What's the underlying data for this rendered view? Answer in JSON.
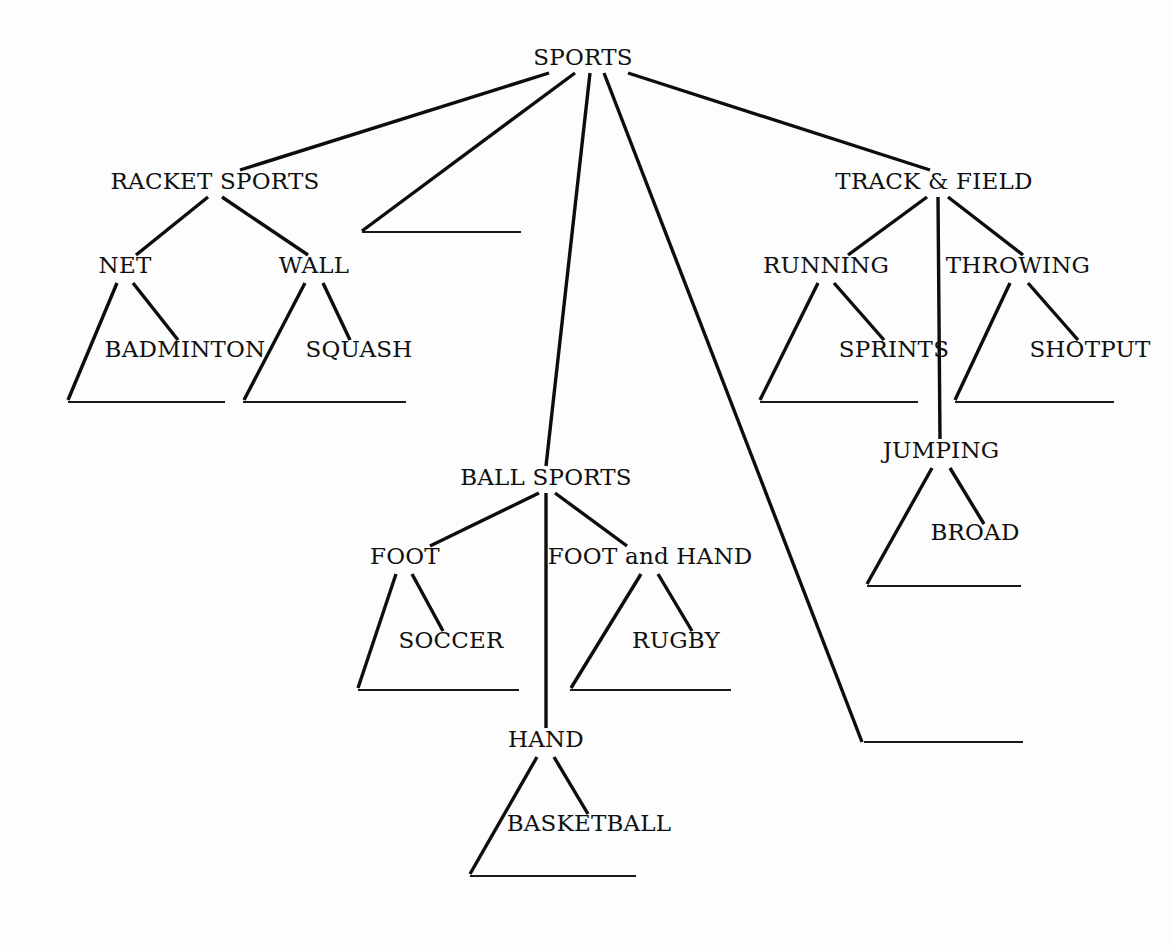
{
  "diagram": {
    "type": "hierarchy-tree-worksheet",
    "background_color": "#fdfdfd",
    "line_color": "#0d0d0d",
    "text_color": "#101010",
    "blank_line_color": "#1a1a1a",
    "nodes": [
      {
        "id": "sports",
        "label": "SPORTS",
        "x": 583,
        "y": 65,
        "level": 0
      },
      {
        "id": "racket_sports",
        "label": "RACKET SPORTS",
        "x": 215,
        "y": 189,
        "level": 1
      },
      {
        "id": "ball_sports",
        "label": "BALL SPORTS",
        "x": 546,
        "y": 485,
        "level": 1
      },
      {
        "id": "track_field",
        "label": "TRACK & FIELD",
        "x": 934,
        "y": 189,
        "level": 1
      },
      {
        "id": "net",
        "label": "NET",
        "x": 125,
        "y": 273,
        "level": 2
      },
      {
        "id": "wall",
        "label": "WALL",
        "x": 314,
        "y": 273,
        "level": 2
      },
      {
        "id": "badminton",
        "label": "BADMINTON",
        "x": 185,
        "y": 357,
        "level": 3
      },
      {
        "id": "squash",
        "label": "SQUASH",
        "x": 359,
        "y": 357,
        "level": 3
      },
      {
        "id": "foot",
        "label": "FOOT",
        "x": 405,
        "y": 564,
        "level": 2
      },
      {
        "id": "foot_and_hand",
        "label": "FOOT and HAND",
        "x": 650,
        "y": 564,
        "level": 2
      },
      {
        "id": "hand",
        "label": "HAND",
        "x": 546,
        "y": 747,
        "level": 2
      },
      {
        "id": "soccer",
        "label": "SOCCER",
        "x": 451,
        "y": 648,
        "level": 3
      },
      {
        "id": "rugby",
        "label": "RUGBY",
        "x": 676,
        "y": 648,
        "level": 3
      },
      {
        "id": "basketball",
        "label": "BASKETBALL",
        "x": 589,
        "y": 831,
        "level": 3
      },
      {
        "id": "running",
        "label": "RUNNING",
        "x": 826,
        "y": 273,
        "level": 2
      },
      {
        "id": "throwing",
        "label": "THROWING",
        "x": 1018,
        "y": 273,
        "level": 2
      },
      {
        "id": "jumping",
        "label": "JUMPING",
        "x": 941,
        "y": 458,
        "level": 2
      },
      {
        "id": "sprints",
        "label": "SPRINTS",
        "x": 894,
        "y": 357,
        "level": 3
      },
      {
        "id": "shotput",
        "label": "SHOTPUT",
        "x": 1090,
        "y": 357,
        "level": 3
      },
      {
        "id": "broad",
        "label": "BROAD",
        "x": 975,
        "y": 540,
        "level": 3
      }
    ],
    "edges": [
      {
        "id": "e-sports-racket",
        "from": "SPORTS",
        "to": "RACKET SPORTS",
        "x1": 549,
        "y1": 73,
        "x2": 240,
        "y2": 170
      },
      {
        "id": "e-sports-blank-upper",
        "from": "SPORTS",
        "to": "blank-upper",
        "x1": 575,
        "y1": 73,
        "x2": 362,
        "y2": 231
      },
      {
        "id": "e-sports-ball",
        "from": "SPORTS",
        "to": "BALL SPORTS",
        "x1": 590,
        "y1": 73,
        "x2": 546,
        "y2": 466
      },
      {
        "id": "e-sports-blank-lower",
        "from": "SPORTS",
        "to": "blank-lower",
        "x1": 604,
        "y1": 73,
        "x2": 862,
        "y2": 742
      },
      {
        "id": "e-sports-track",
        "from": "SPORTS",
        "to": "TRACK & FIELD",
        "x1": 628,
        "y1": 73,
        "x2": 930,
        "y2": 170
      },
      {
        "id": "e-racket-net",
        "from": "RACKET SPORTS",
        "to": "NET",
        "x1": 208,
        "y1": 197,
        "x2": 136,
        "y2": 255
      },
      {
        "id": "e-racket-wall",
        "from": "RACKET SPORTS",
        "to": "WALL",
        "x1": 222,
        "y1": 197,
        "x2": 308,
        "y2": 255
      },
      {
        "id": "e-net-blank",
        "from": "NET",
        "to": "blank-net",
        "x1": 117,
        "y1": 283,
        "x2": 68,
        "y2": 400
      },
      {
        "id": "e-net-badminton",
        "from": "NET",
        "to": "BADMINTON",
        "x1": 133,
        "y1": 283,
        "x2": 178,
        "y2": 340
      },
      {
        "id": "e-wall-blank",
        "from": "WALL",
        "to": "blank-wall",
        "x1": 305,
        "y1": 283,
        "x2": 244,
        "y2": 400
      },
      {
        "id": "e-wall-squash",
        "from": "WALL",
        "to": "SQUASH",
        "x1": 323,
        "y1": 283,
        "x2": 350,
        "y2": 340
      },
      {
        "id": "e-ball-foot",
        "from": "BALL SPORTS",
        "to": "FOOT",
        "x1": 539,
        "y1": 493,
        "x2": 430,
        "y2": 546
      },
      {
        "id": "e-ball-hand",
        "from": "BALL SPORTS",
        "to": "HAND",
        "x1": 546,
        "y1": 493,
        "x2": 546,
        "y2": 728
      },
      {
        "id": "e-ball-foothand",
        "from": "BALL SPORTS",
        "to": "FOOT and HAND",
        "x1": 555,
        "y1": 493,
        "x2": 627,
        "y2": 546
      },
      {
        "id": "e-foot-blank",
        "from": "FOOT",
        "to": "blank-foot",
        "x1": 396,
        "y1": 574,
        "x2": 358,
        "y2": 688
      },
      {
        "id": "e-foot-soccer",
        "from": "FOOT",
        "to": "SOCCER",
        "x1": 412,
        "y1": 574,
        "x2": 443,
        "y2": 631
      },
      {
        "id": "e-foothand-blank",
        "from": "FOOT and HAND",
        "to": "blank-foothand",
        "x1": 641,
        "y1": 574,
        "x2": 571,
        "y2": 688
      },
      {
        "id": "e-foothand-rugby",
        "from": "FOOT and HAND",
        "to": "RUGBY",
        "x1": 658,
        "y1": 574,
        "x2": 692,
        "y2": 631
      },
      {
        "id": "e-hand-blank",
        "from": "HAND",
        "to": "blank-hand",
        "x1": 537,
        "y1": 757,
        "x2": 470,
        "y2": 874
      },
      {
        "id": "e-hand-basketball",
        "from": "HAND",
        "to": "BASKETBALL",
        "x1": 554,
        "y1": 757,
        "x2": 588,
        "y2": 814
      },
      {
        "id": "e-track-running",
        "from": "TRACK & FIELD",
        "to": "RUNNING",
        "x1": 927,
        "y1": 197,
        "x2": 848,
        "y2": 255
      },
      {
        "id": "e-track-jumping",
        "from": "TRACK & FIELD",
        "to": "JUMPING",
        "x1": 938,
        "y1": 197,
        "x2": 940,
        "y2": 439
      },
      {
        "id": "e-track-throwing",
        "from": "TRACK & FIELD",
        "to": "THROWING",
        "x1": 948,
        "y1": 197,
        "x2": 1023,
        "y2": 255
      },
      {
        "id": "e-running-blank",
        "from": "RUNNING",
        "to": "blank-running",
        "x1": 818,
        "y1": 283,
        "x2": 760,
        "y2": 400
      },
      {
        "id": "e-running-sprints",
        "from": "RUNNING",
        "to": "SPRINTS",
        "x1": 834,
        "y1": 283,
        "x2": 884,
        "y2": 340
      },
      {
        "id": "e-throwing-blank",
        "from": "THROWING",
        "to": "blank-throwing",
        "x1": 1010,
        "y1": 283,
        "x2": 955,
        "y2": 400
      },
      {
        "id": "e-throwing-shotput",
        "from": "THROWING",
        "to": "SHOTPUT",
        "x1": 1028,
        "y1": 283,
        "x2": 1078,
        "y2": 340
      },
      {
        "id": "e-jumping-blank",
        "from": "JUMPING",
        "to": "blank-jumping",
        "x1": 932,
        "y1": 468,
        "x2": 867,
        "y2": 584
      },
      {
        "id": "e-jumping-broad",
        "from": "JUMPING",
        "to": "BROAD",
        "x1": 950,
        "y1": 468,
        "x2": 984,
        "y2": 524
      }
    ],
    "blanks": [
      {
        "id": "blank-upper",
        "label": "",
        "x1": 362,
        "y": 232,
        "x2": 521
      },
      {
        "id": "blank-net",
        "label": "",
        "x1": 68,
        "y": 402,
        "x2": 225
      },
      {
        "id": "blank-wall",
        "label": "",
        "x1": 243,
        "y": 402,
        "x2": 406
      },
      {
        "id": "blank-running",
        "label": "",
        "x1": 760,
        "y": 402,
        "x2": 918
      },
      {
        "id": "blank-throwing",
        "label": "",
        "x1": 955,
        "y": 402,
        "x2": 1114
      },
      {
        "id": "blank-jumping",
        "label": "",
        "x1": 867,
        "y": 586,
        "x2": 1021
      },
      {
        "id": "blank-foot",
        "label": "",
        "x1": 358,
        "y": 690,
        "x2": 519
      },
      {
        "id": "blank-foothand",
        "label": "",
        "x1": 570,
        "y": 690,
        "x2": 731
      },
      {
        "id": "blank-lower",
        "label": "",
        "x1": 864,
        "y": 742,
        "x2": 1023
      },
      {
        "id": "blank-hand",
        "label": "",
        "x1": 470,
        "y": 876,
        "x2": 636
      }
    ]
  }
}
